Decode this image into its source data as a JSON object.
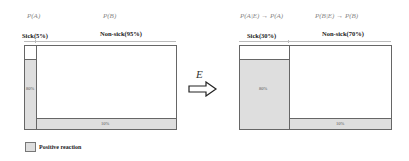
{
  "before": {
    "label_a": "P(A)",
    "label_b": "P(B)",
    "sick_label": "Sick(5%)",
    "nonsick_label": "Non-sick(95%)",
    "sick_positive_pct": "80%",
    "nonsick_positive_pct": "10%"
  },
  "transition": {
    "evidence_label": "E",
    "arrow_icon": "hollow-right-arrow"
  },
  "after": {
    "label_a": "P(A|E) → P(A)",
    "label_b": "P(B|E) → P(B)",
    "sick_label": "Sick(30%)",
    "nonsick_label": "Non-sick(70%)",
    "sick_positive_pct": "80%",
    "nonsick_positive_pct": "10%"
  },
  "legend": {
    "label": "Positive reaction",
    "swatch_color": "#dedede"
  }
}
